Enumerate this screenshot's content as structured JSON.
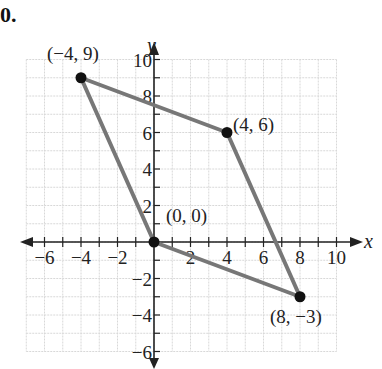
{
  "problem_number": "0.",
  "chart_data": {
    "type": "line",
    "title": "",
    "xlabel": "x",
    "ylabel": "y",
    "xlim": [
      -7,
      10.5
    ],
    "ylim": [
      -6.5,
      10.5
    ],
    "grid": true,
    "x_ticks": [
      -6,
      -4,
      -2,
      2,
      4,
      6,
      8,
      10
    ],
    "y_ticks": [
      -6,
      -4,
      -2,
      2,
      4,
      6,
      8,
      10
    ],
    "series": [
      {
        "name": "quadrilateral",
        "points": [
          [
            0,
            0
          ],
          [
            -4,
            9
          ],
          [
            4,
            6
          ],
          [
            8,
            -3
          ],
          [
            0,
            0
          ]
        ],
        "color": "#777777"
      }
    ],
    "points": [
      {
        "x": -4,
        "y": 9,
        "label": "(−4, 9)"
      },
      {
        "x": 4,
        "y": 6,
        "label": "(4, 6)"
      },
      {
        "x": 0,
        "y": 0,
        "label": "(0, 0)"
      },
      {
        "x": 8,
        "y": -3,
        "label": "(8, −3)"
      }
    ]
  }
}
